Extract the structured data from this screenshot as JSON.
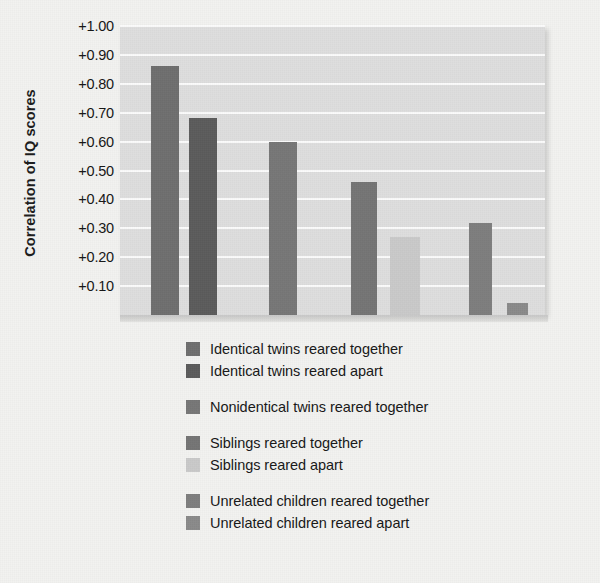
{
  "chart_data": {
    "type": "bar",
    "title": "",
    "xlabel": "",
    "ylabel": "Correlation of IQ scores",
    "ylim": [
      0,
      1.0
    ],
    "grid": true,
    "legend_position": "bottom",
    "ytick_labels": [
      "+1.00",
      "+0.90",
      "+0.80",
      "+0.70",
      "+0.60",
      "+0.50",
      "+0.40",
      "+0.30",
      "+0.20",
      "+0.10"
    ],
    "ytick_values": [
      1.0,
      0.9,
      0.8,
      0.7,
      0.6,
      0.5,
      0.4,
      0.3,
      0.2,
      0.1
    ],
    "categories": [
      "Identical twins reared together",
      "Identical twins reared apart",
      "Nonidentical twins reared together",
      "Siblings reared together",
      "Siblings reared apart",
      "Unrelated children reared together",
      "Unrelated children reared apart"
    ],
    "values": [
      0.86,
      0.68,
      0.6,
      0.46,
      0.27,
      0.32,
      0.04
    ],
    "colors": [
      "#6e6e6e",
      "#5b5b5b",
      "#767676",
      "#747474",
      "#c9c9c9",
      "#7d7d7d",
      "#8a8a8a"
    ],
    "bar_left_px": [
      31,
      69,
      149,
      231,
      270,
      349,
      387
    ],
    "bar_width_px": [
      28,
      28,
      28,
      26,
      30,
      23,
      21
    ],
    "plot_bg": "#dedede",
    "gridline_color": "#fbfbfb",
    "page_bg": "#f2f2f0"
  },
  "legend": {
    "groups": [
      {
        "entries": [
          {
            "label": "Identical twins reared together",
            "color": "#6e6e6e",
            "swatch_name": "legend-swatch-identical-together"
          },
          {
            "label": "Identical twins reared apart",
            "color": "#5b5b5b",
            "swatch_name": "legend-swatch-identical-apart"
          }
        ]
      },
      {
        "entries": [
          {
            "label": "Nonidentical twins reared together",
            "color": "#767676",
            "swatch_name": "legend-swatch-nonidentical-together"
          }
        ]
      },
      {
        "entries": [
          {
            "label": "Siblings reared together",
            "color": "#747474",
            "swatch_name": "legend-swatch-siblings-together"
          },
          {
            "label": "Siblings reared apart",
            "color": "#c9c9c9",
            "swatch_name": "legend-swatch-siblings-apart"
          }
        ]
      },
      {
        "entries": [
          {
            "label": "Unrelated children reared together",
            "color": "#7d7d7d",
            "swatch_name": "legend-swatch-unrelated-together"
          },
          {
            "label": "Unrelated children reared apart",
            "color": "#8a8a8a",
            "swatch_name": "legend-swatch-unrelated-apart"
          }
        ]
      }
    ]
  }
}
